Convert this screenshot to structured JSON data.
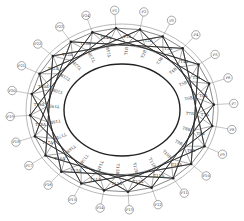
{
  "diagram": {
    "type": "cable-net ring truss plan",
    "center": [
      122,
      110
    ],
    "outer_ellipse": {
      "rx": 96,
      "ry": 86
    },
    "label_ring": {
      "rx": 112,
      "ry": 100
    },
    "node_ring": {
      "rx": 92,
      "ry": 82
    },
    "inner_ring": {
      "rx": 74,
      "ry": 65
    },
    "inner_ellipse": {
      "rx": 58,
      "ry": 46
    },
    "node_count": 24,
    "chord_skip": 5,
    "colors": {
      "line": "#555555",
      "dark": "#222222",
      "light": "#888888",
      "background": "#ffffff"
    },
    "node_labels": [
      "P1",
      "P2",
      "P3",
      "P4",
      "P5",
      "P6",
      "P7",
      "P8",
      "P9",
      "P10",
      "P11",
      "P12",
      "P13",
      "P14",
      "P15",
      "P16",
      "P17",
      "P18",
      "P19",
      "P20",
      "P21",
      "P22",
      "P23",
      "P24"
    ],
    "member_labels_a": [
      "T1A",
      "T2A",
      "T3A",
      "T4A",
      "T5A",
      "T6A",
      "T7A",
      "T8A",
      "T9A",
      "T10A",
      "T11A",
      "T12A",
      "T13A",
      "T14A",
      "T15A",
      "T16A",
      "T17A",
      "T18A",
      "T19A",
      "T20A",
      "T21A",
      "T22A",
      "T23A",
      "T24A"
    ],
    "member_labels_b": [
      "T1B",
      "T2B",
      "T3B",
      "T4B",
      "T5B",
      "T6B",
      "T7B",
      "T8B",
      "T9B",
      "T10B",
      "T11B",
      "T12B",
      "T13B",
      "T14B",
      "T15B",
      "T16B",
      "T17B",
      "T18B",
      "T19B",
      "T20B",
      "T21B",
      "T22B",
      "T23B",
      "T24B"
    ]
  }
}
